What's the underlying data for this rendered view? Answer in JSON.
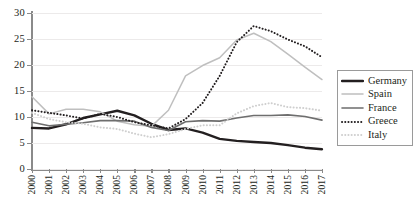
{
  "chart_data": {
    "type": "line",
    "title": "",
    "xlabel": "",
    "ylabel": "",
    "x": [
      2000,
      2001,
      2002,
      2003,
      2004,
      2005,
      2006,
      2007,
      2008,
      2009,
      2010,
      2011,
      2012,
      2013,
      2014,
      2015,
      2016,
      2017
    ],
    "categories": [
      "2000",
      "2001",
      "2002",
      "2003",
      "2004",
      "2005",
      "2006",
      "2007",
      "2008",
      "2009",
      "2010",
      "2011",
      "2012",
      "2013",
      "2014",
      "2015",
      "2016",
      "2017"
    ],
    "xlim": [
      2000,
      2017
    ],
    "ylim": [
      0,
      30
    ],
    "yticks": [
      0,
      5,
      10,
      15,
      20,
      25,
      30
    ],
    "ytick_labels": [
      "0",
      "5",
      "10",
      "15",
      "20",
      "25",
      "30"
    ],
    "grid": "horizontal",
    "legend_position": "right",
    "series": [
      {
        "name": "Germany",
        "color": "#231f20",
        "style": "solid",
        "width": 2.4,
        "values": [
          7.9,
          7.8,
          8.6,
          9.8,
          10.5,
          11.2,
          10.3,
          8.7,
          7.5,
          7.8,
          7.0,
          5.8,
          5.4,
          5.2,
          5.0,
          4.6,
          4.1,
          3.8
        ]
      },
      {
        "name": "Spain",
        "color": "#bfbfbf",
        "style": "solid",
        "width": 1.5,
        "values": [
          13.9,
          10.6,
          11.5,
          11.5,
          11.0,
          9.2,
          8.5,
          8.2,
          11.3,
          17.9,
          19.9,
          21.4,
          24.8,
          26.1,
          24.5,
          22.1,
          19.6,
          17.2
        ]
      },
      {
        "name": "France",
        "color": "#6e6e6e",
        "style": "solid",
        "width": 1.6,
        "values": [
          9.0,
          8.3,
          8.6,
          8.9,
          9.3,
          9.3,
          9.2,
          8.0,
          7.4,
          9.1,
          9.3,
          9.2,
          9.8,
          10.3,
          10.3,
          10.4,
          10.1,
          9.4
        ]
      },
      {
        "name": "Greece",
        "color": "#231f20",
        "style": "dotted",
        "width": 2.0,
        "values": [
          11.3,
          10.8,
          10.3,
          9.7,
          10.6,
          10.0,
          9.0,
          8.4,
          7.8,
          9.6,
          12.7,
          17.9,
          24.4,
          27.5,
          26.5,
          24.9,
          23.6,
          21.5
        ]
      },
      {
        "name": "Italy",
        "color": "#cfcfcf",
        "style": "dotted",
        "width": 2.0,
        "values": [
          10.8,
          9.6,
          9.0,
          8.7,
          8.0,
          7.7,
          6.8,
          6.1,
          6.7,
          7.7,
          8.4,
          8.4,
          10.7,
          12.1,
          12.7,
          11.9,
          11.7,
          11.2
        ]
      }
    ]
  },
  "legend": {
    "items": [
      {
        "label": "Germany"
      },
      {
        "label": "Spain"
      },
      {
        "label": "France"
      },
      {
        "label": "Greece"
      },
      {
        "label": "Italy"
      }
    ]
  }
}
